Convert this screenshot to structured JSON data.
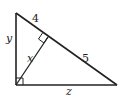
{
  "diagram": {
    "type": "right-triangle-with-altitude",
    "stroke_color": "#222222",
    "vertices": {
      "top": [
        16,
        13
      ],
      "right_angle": [
        16,
        85
      ],
      "bottom_right": [
        117,
        85
      ],
      "altitude_foot": [
        48,
        37
      ]
    },
    "labels": {
      "hyp_upper": "4",
      "hyp_lower": "5",
      "left_leg": "y",
      "altitude": "x",
      "bottom_leg": "z"
    }
  }
}
